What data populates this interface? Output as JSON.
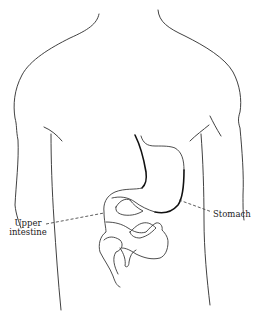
{
  "diagram": {
    "labels": {
      "upper_intestine_line1": "Upper",
      "upper_intestine_line2": "intestine",
      "stomach": "Stomach"
    },
    "colors": {
      "background": "#ffffff",
      "line": "#2b2b2b",
      "text": "#222222"
    }
  }
}
